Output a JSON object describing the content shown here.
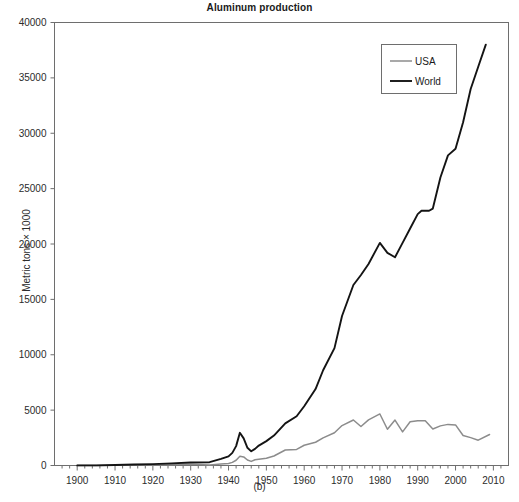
{
  "chart_data": {
    "type": "line",
    "title": "Aluminum production",
    "xlabel": "(b)",
    "ylabel": "Metric tons × 1000",
    "xlim": [
      1894,
      2014
    ],
    "ylim": [
      0,
      40000
    ],
    "xticks": [
      1900,
      1910,
      1920,
      1930,
      1940,
      1950,
      1960,
      1970,
      1980,
      1990,
      2000,
      2010
    ],
    "yticks": [
      0,
      5000,
      10000,
      15000,
      20000,
      25000,
      30000,
      35000,
      40000
    ],
    "grid": false,
    "legend_position": "top-right",
    "series": [
      {
        "name": "USA",
        "color": "#8c8c8c",
        "x": [
          1900,
          1905,
          1910,
          1915,
          1920,
          1925,
          1930,
          1935,
          1938,
          1940,
          1941,
          1942,
          1943,
          1944,
          1945,
          1946,
          1947,
          1948,
          1950,
          1952,
          1955,
          1958,
          1960,
          1963,
          1965,
          1968,
          1970,
          1973,
          1975,
          1977,
          1980,
          1982,
          1984,
          1986,
          1988,
          1990,
          1992,
          1994,
          1996,
          1998,
          2000,
          2002,
          2004,
          2006,
          2009
        ],
        "values": [
          3,
          6,
          20,
          45,
          70,
          70,
          104,
          54,
          130,
          187,
          280,
          472,
          835,
          776,
          495,
          371,
          517,
          565,
          652,
          860,
          1400,
          1450,
          1828,
          2098,
          2499,
          2953,
          3607,
          4109,
          3519,
          4117,
          4654,
          3274,
          4099,
          3037,
          3944,
          4048,
          4042,
          3299,
          3577,
          3713,
          3668,
          2707,
          2516,
          2284,
          2800
        ]
      },
      {
        "name": "World",
        "color": "#141414",
        "x": [
          1900,
          1905,
          1910,
          1915,
          1920,
          1925,
          1930,
          1935,
          1938,
          1940,
          1941,
          1942,
          1943,
          1944,
          1945,
          1946,
          1947,
          1948,
          1950,
          1952,
          1955,
          1958,
          1960,
          1963,
          1965,
          1968,
          1970,
          1973,
          1975,
          1977,
          1980,
          1982,
          1984,
          1986,
          1988,
          1990,
          1991,
          1993,
          1994,
          1996,
          1998,
          2000,
          2002,
          2004,
          2006,
          2008
        ],
        "values": [
          8,
          13,
          45,
          90,
          128,
          190,
          270,
          300,
          600,
          820,
          1140,
          1750,
          2950,
          2450,
          1600,
          1280,
          1500,
          1800,
          2200,
          2700,
          3800,
          4450,
          5350,
          6900,
          8600,
          10600,
          13500,
          16300,
          17200,
          18200,
          20100,
          19200,
          18800,
          20100,
          21400,
          22700,
          23000,
          23000,
          23200,
          26000,
          28000,
          28600,
          31000,
          34000,
          36000,
          38000
        ]
      }
    ]
  },
  "legend": {
    "items": [
      {
        "label": "USA",
        "color": "#8c8c8c"
      },
      {
        "label": "World",
        "color": "#141414"
      }
    ]
  },
  "axes": {
    "y_tick_labels": [
      "0",
      "5000",
      "10000",
      "15000",
      "20000",
      "25000",
      "30000",
      "35000",
      "40000"
    ],
    "x_tick_labels": [
      "1900",
      "1910",
      "1920",
      "1930",
      "1940",
      "1950",
      "1960",
      "1970",
      "1980",
      "1990",
      "2000",
      "2010"
    ]
  },
  "colors": {
    "background": "#ffffff",
    "axis": "#6e6e6e",
    "text": "#1a1a1a",
    "usa_line": "#8c8c8c",
    "world_line": "#141414"
  }
}
